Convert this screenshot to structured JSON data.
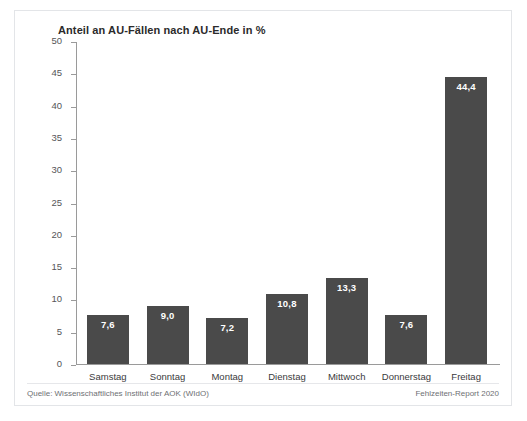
{
  "chart_data": {
    "type": "bar",
    "title": "Anteil an AU-Fällen nach AU-Ende in %",
    "xlabel": "",
    "ylabel": "",
    "ylim": [
      0,
      50
    ],
    "ytick_step": 5,
    "yticks": [
      "50",
      "45",
      "40",
      "35",
      "30",
      "25",
      "20",
      "15",
      "10",
      "5",
      "0"
    ],
    "grid": false,
    "legend": "none",
    "categories": [
      "Samstag",
      "Sonntag",
      "Montag",
      "Dienstag",
      "Mittwoch",
      "Donnerstag",
      "Freitag"
    ],
    "values": [
      7.6,
      9.0,
      7.2,
      10.8,
      13.3,
      7.6,
      44.4
    ],
    "value_labels": [
      "7,6",
      "9,0",
      "7,2",
      "10,8",
      "13,3",
      "7,6",
      "44,4"
    ],
    "bar_color": "#4a4a4a",
    "value_label_color": "#ffffff"
  },
  "footer": {
    "source": "Quelle: Wissenschaftliches Institut der AOK (WIdO)",
    "report": "Fehlzeiten-Report 2020"
  }
}
